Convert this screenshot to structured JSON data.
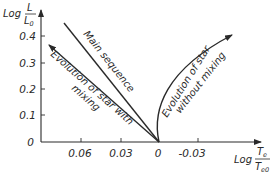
{
  "figure": {
    "y_axis": {
      "label_prefix": "Log",
      "label_numerator": "L",
      "label_denominator": "L",
      "label_denominator_sub": "0",
      "ticks": [
        "0.4",
        "0.3",
        "0.2",
        "0.1",
        "0"
      ]
    },
    "x_axis": {
      "label_prefix": "Log",
      "label_numerator": "T",
      "label_numerator_sub": "e",
      "label_denominator": "T",
      "label_denominator_sub": "e0",
      "ticks": [
        "0.06",
        "0.03",
        "0",
        "-0.03"
      ]
    },
    "curves": {
      "main_sequence": "Main sequence",
      "with_mixing_line1": "Evolution of star with",
      "with_mixing_line2": "mixing",
      "without_mixing_line1": "Evolution of star",
      "without_mixing_line2": "without mixing"
    },
    "colors": {
      "ink": "#2a2a2a",
      "background": "#ffffff"
    }
  }
}
